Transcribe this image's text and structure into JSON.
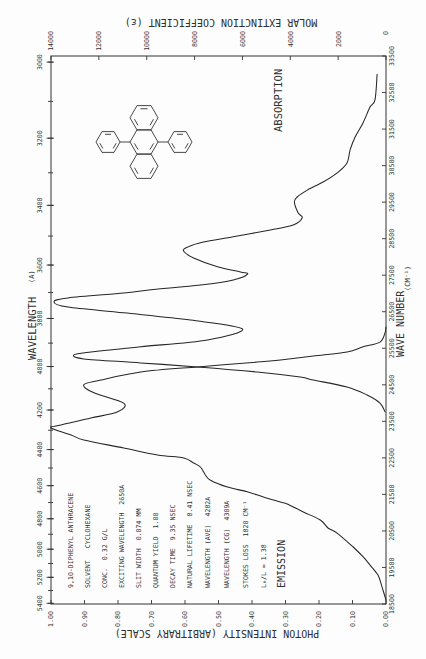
{
  "page": {
    "background": "#fdfdfd",
    "ink_color": "#2f2f2f"
  },
  "info": {
    "lines": [
      "9,10-DIPHENYL ANTHRACENE",
      "SOLVENT   CYCLOHEXANE",
      "CONC.  0.32 G/L",
      "EXCITING WAVELENGTH  2650A",
      "SLIT WIDTH  0.074 MM",
      "QUANTUM YIELD  1.00",
      "DECAY TIME  9.35 NSEC",
      "NATURAL LIFETIME  8.41 NSEC",
      "WAVELENGTH (AVE)  4282A",
      "WAVELENGTH (CG)  4309A",
      "STOKES LOSS  1820 CM⁻¹",
      "L₀/L = 1.38"
    ]
  },
  "labels": {
    "absorption": "ABSORPTION",
    "emission": "EMISSION"
  },
  "chart_data": {
    "type": "line",
    "title": "9,10-DIPHENYL ANTHRACENE",
    "orientation": "rotated 90 degrees counter-clockwise",
    "grid": false,
    "legend": "none (curves labelled ABSORPTION and EMISSION)",
    "axes": {
      "wavelength": {
        "label": "WAVELENGTH",
        "unit": "(A)",
        "side": "left",
        "range": [
          3000,
          5400
        ],
        "minor_step": 100,
        "ticks": [
          3000,
          3200,
          3400,
          3600,
          3800,
          4000,
          4200,
          4400,
          4600,
          4800,
          5000,
          5200,
          5400
        ]
      },
      "wave_number": {
        "label": "WAVE NUMBER",
        "unit": "(CM⁻¹)",
        "side": "right",
        "range": [
          18500,
          33500
        ],
        "ticks": [
          33500,
          32500,
          31500,
          30500,
          29500,
          28500,
          27500,
          26500,
          25500,
          24500,
          23500,
          22500,
          21500,
          20500,
          19500,
          18500
        ]
      },
      "molar_extinction": {
        "label": "MOLAR EXTINCTION COEFFICIENT (ε)",
        "side": "top",
        "range": [
          0,
          14000
        ],
        "ticks": [
          14000,
          12000,
          10000,
          8000,
          6000,
          4000,
          2000,
          0
        ]
      },
      "photon_intensity": {
        "label": "PHOTON INTENSITY (ARBITRARY SCALE)",
        "side": "bottom",
        "range": [
          0,
          1
        ],
        "ticks": [
          1.0,
          0.9,
          0.8,
          0.7,
          0.6,
          0.5,
          0.4,
          0.3,
          0.2,
          0.1,
          0.0
        ],
        "tick_labels": [
          "1.00",
          "0.90",
          "0.80",
          "0.70",
          "0.60",
          "0.50",
          "0.40",
          "0.30",
          "0.20",
          "0.10",
          "0.00"
        ]
      }
    },
    "series": [
      {
        "name": "ABSORPTION",
        "x_axis": "wave_number",
        "y_axis": "molar_extinction",
        "x": [
          33000,
          32300,
          32100,
          31670,
          31280,
          30930,
          30570,
          30300,
          30050,
          29830,
          29640,
          29500,
          29200,
          29070,
          28870,
          28740,
          28550,
          28410,
          28270,
          28160,
          27970,
          27730,
          27590,
          27530,
          27370,
          27230,
          27100,
          27010,
          26880,
          26770,
          26630,
          26470,
          26270,
          26030,
          25730,
          25540,
          25400,
          25320,
          25210,
          25100,
          24990,
          24850,
          24710,
          24630,
          24440,
          24220,
          24000,
          23760
        ],
        "y": [
          370,
          460,
          670,
          960,
          1290,
          1500,
          1630,
          2040,
          2630,
          3290,
          3710,
          3830,
          3670,
          3500,
          3880,
          4830,
          6380,
          7630,
          8290,
          8460,
          8040,
          7040,
          6080,
          5790,
          6380,
          7750,
          9830,
          10960,
          13290,
          13880,
          13290,
          10960,
          8170,
          6000,
          7460,
          10250,
          12330,
          13040,
          12630,
          10250,
          7880,
          5380,
          3580,
          3040,
          1630,
          790,
          250,
          40
        ]
      },
      {
        "name": "EMISSION",
        "x_axis": "wave_number",
        "y_axis": "photon_intensity",
        "x": [
          26080,
          25920,
          25670,
          25540,
          25400,
          25290,
          25180,
          25120,
          24990,
          24850,
          24630,
          24500,
          24280,
          24000,
          23760,
          23590,
          23400,
          23320,
          23130,
          22990,
          22770,
          22580,
          22500,
          22360,
          22250,
          22030,
          21890,
          21700,
          21570,
          21430,
          21290,
          21240,
          21020,
          20800,
          20580,
          20440,
          20060,
          19790,
          19570,
          19290,
          18970,
          18610
        ],
        "y": [
          0.0,
          0.003,
          0.018,
          0.068,
          0.116,
          0.217,
          0.315,
          0.384,
          0.563,
          0.732,
          0.851,
          0.902,
          0.872,
          0.783,
          0.801,
          0.881,
          0.97,
          1.0,
          0.94,
          0.902,
          0.783,
          0.682,
          0.604,
          0.574,
          0.554,
          0.539,
          0.524,
          0.473,
          0.414,
          0.366,
          0.315,
          0.295,
          0.247,
          0.196,
          0.173,
          0.146,
          0.098,
          0.068,
          0.048,
          0.024,
          0.012,
          0.0
        ]
      }
    ],
    "annotations": [
      "ABSORPTION",
      "EMISSION",
      "structure: 9,10-diphenylanthracene"
    ]
  }
}
